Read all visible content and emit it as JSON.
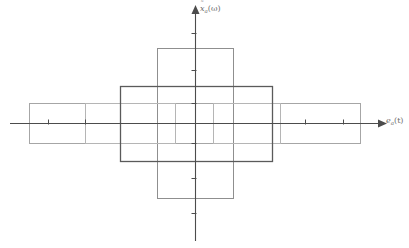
{
  "figure": {
    "width": 409,
    "height": 248,
    "background": "#ffffff"
  },
  "axes": {
    "x": {
      "label_base": "e",
      "label_sub": "a",
      "label_arg": "(t)",
      "label_full": "e_a(t)",
      "color": "#4c4c4c",
      "line": {
        "x1": 10,
        "y1": 123,
        "x2": 381,
        "y2": 123
      },
      "arrow": "right",
      "ticks": [
        {
          "x": 48,
          "label": ""
        },
        {
          "x": 85,
          "label": ""
        },
        {
          "x": 305,
          "label": ""
        },
        {
          "x": 343,
          "label": ""
        }
      ],
      "tick_length": 5
    },
    "y": {
      "label_base": "x",
      "label_accent": "tilde",
      "label_sub": "a",
      "label_arg": "(ω)",
      "label_full": "x̃_a(ω)",
      "color": "#4c4c4c",
      "line": {
        "x1": 195,
        "y1": 12,
        "x2": 195,
        "y2": 241
      },
      "arrow": "up",
      "ticks": [
        {
          "y": 33,
          "label": ""
        },
        {
          "y": 70,
          "label": ""
        },
        {
          "y": 103,
          "label": ""
        },
        {
          "y": 143,
          "label": ""
        },
        {
          "y": 178,
          "label": ""
        },
        {
          "y": 213,
          "label": ""
        }
      ],
      "tick_length": 5
    }
  },
  "shapes": {
    "wide_rect": {
      "name": "wide-horizontal-rectangle",
      "x": 29,
      "y": 103,
      "width": 331,
      "height": 40,
      "stroke": "#a6a6a6",
      "stroke_width": 1,
      "fill": "none"
    },
    "tall_rect": {
      "name": "tall-vertical-rectangle",
      "x": 157,
      "y": 48,
      "width": 76,
      "height": 150,
      "stroke": "#8f8f8f",
      "stroke_width": 1,
      "fill": "none"
    },
    "center_square": {
      "name": "center-dark-square",
      "x": 120,
      "y": 86,
      "width": 152,
      "height": 75,
      "stroke": "#5a5a5a",
      "stroke_width": 1.3,
      "fill": "none"
    },
    "inner_left_rect": {
      "name": "inner-left-rectangle",
      "x": 85,
      "y": 103,
      "width": 90,
      "height": 40,
      "stroke": "#b5b5b5",
      "stroke_width": 1,
      "fill": "none"
    },
    "inner_right_rect": {
      "name": "inner-right-rectangle",
      "x": 213,
      "y": 103,
      "width": 67,
      "height": 40,
      "stroke": "#b5b5b5",
      "stroke_width": 1,
      "fill": "none"
    }
  },
  "colors": {
    "axis": "#4c4c4c",
    "light_stroke": "#a6a6a6",
    "mid_stroke": "#8f8f8f",
    "dark_stroke": "#5a5a5a",
    "faint_stroke": "#b5b5b5",
    "text": "#6d6d6d",
    "background": "#ffffff"
  }
}
